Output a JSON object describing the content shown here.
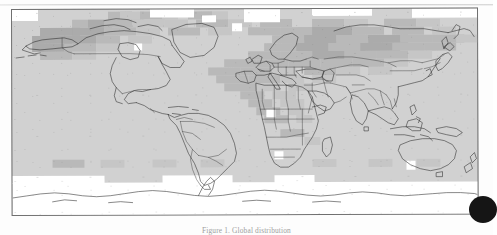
{
  "figure": {
    "kind": "world-map",
    "projection": "equirectangular",
    "caption": "Figure 1.  Global distribution",
    "frame_color": "#6f6f6f",
    "background_color": "#d2d2d2"
  },
  "artifacts": {
    "page_edge_label": "page-edge-line",
    "edge_blob_label": "scan-blob"
  },
  "chart_data": {
    "type": "heatmap",
    "title": "",
    "xlabel": "",
    "ylabel": "",
    "xlim": [
      -180,
      180
    ],
    "ylim": [
      -90,
      90
    ],
    "grid": false,
    "legend": "none",
    "cell_size_deg": [
      6,
      6
    ],
    "palette": {
      "nodata": "#ffffff",
      "level_0": "#d2d2d2",
      "level_1": "#c6c6c6",
      "level_2": "#b9b9b9",
      "level_3": "#ababab",
      "level_4": "#9d9d9d"
    },
    "cells": [
      [
        96,
        2,
        3,
        2
      ],
      [
        108,
        2,
        3,
        1
      ],
      [
        128,
        2,
        3,
        2
      ],
      [
        150,
        2,
        2,
        1
      ],
      [
        176,
        2,
        3,
        2
      ],
      [
        200,
        2,
        2,
        1
      ],
      [
        232,
        2,
        3,
        1
      ],
      [
        60,
        10,
        4,
        2
      ],
      [
        76,
        10,
        3,
        3
      ],
      [
        92,
        10,
        5,
        2
      ],
      [
        120,
        10,
        4,
        1
      ],
      [
        152,
        10,
        3,
        1
      ],
      [
        184,
        10,
        4,
        2
      ],
      [
        216,
        10,
        3,
        1
      ],
      [
        248,
        10,
        4,
        2
      ],
      [
        300,
        10,
        4,
        2
      ],
      [
        332,
        10,
        3,
        1
      ],
      [
        372,
        10,
        4,
        2
      ],
      [
        404,
        10,
        3,
        1
      ],
      [
        28,
        18,
        5,
        3
      ],
      [
        60,
        18,
        4,
        3
      ],
      [
        92,
        18,
        4,
        2
      ],
      [
        124,
        18,
        3,
        1
      ],
      [
        156,
        18,
        4,
        2
      ],
      [
        196,
        18,
        3,
        1
      ],
      [
        236,
        18,
        4,
        2
      ],
      [
        268,
        18,
        4,
        2
      ],
      [
        300,
        18,
        5,
        3
      ],
      [
        340,
        18,
        4,
        2
      ],
      [
        380,
        18,
        4,
        2
      ],
      [
        420,
        18,
        3,
        1
      ],
      [
        20,
        26,
        5,
        3
      ],
      [
        52,
        26,
        4,
        3
      ],
      [
        84,
        26,
        3,
        2
      ],
      [
        116,
        26,
        3,
        1
      ],
      [
        260,
        26,
        4,
        2
      ],
      [
        292,
        26,
        5,
        3
      ],
      [
        324,
        26,
        4,
        2
      ],
      [
        356,
        26,
        5,
        3
      ],
      [
        388,
        26,
        4,
        2
      ],
      [
        420,
        26,
        4,
        2
      ],
      [
        444,
        26,
        3,
        1
      ],
      [
        20,
        34,
        5,
        3
      ],
      [
        52,
        34,
        4,
        2
      ],
      [
        84,
        34,
        3,
        1
      ],
      [
        252,
        34,
        4,
        2
      ],
      [
        284,
        34,
        5,
        3
      ],
      [
        316,
        34,
        4,
        2
      ],
      [
        348,
        34,
        5,
        3
      ],
      [
        380,
        34,
        4,
        2
      ],
      [
        412,
        34,
        4,
        2
      ],
      [
        28,
        42,
        4,
        2
      ],
      [
        60,
        42,
        3,
        1
      ],
      [
        236,
        42,
        4,
        2
      ],
      [
        268,
        42,
        4,
        2
      ],
      [
        300,
        42,
        5,
        3
      ],
      [
        332,
        42,
        4,
        2
      ],
      [
        364,
        42,
        4,
        2
      ],
      [
        396,
        42,
        3,
        1
      ],
      [
        212,
        50,
        4,
        2
      ],
      [
        244,
        50,
        4,
        2
      ],
      [
        276,
        50,
        4,
        2
      ],
      [
        308,
        50,
        4,
        2
      ],
      [
        340,
        50,
        4,
        2
      ],
      [
        372,
        50,
        3,
        1
      ],
      [
        196,
        58,
        4,
        2
      ],
      [
        228,
        58,
        4,
        2
      ],
      [
        260,
        58,
        3,
        1
      ],
      [
        292,
        58,
        4,
        2
      ],
      [
        324,
        58,
        3,
        1
      ],
      [
        356,
        58,
        3,
        1
      ],
      [
        204,
        66,
        4,
        2
      ],
      [
        236,
        66,
        4,
        2
      ],
      [
        268,
        66,
        3,
        1
      ],
      [
        300,
        66,
        3,
        1
      ],
      [
        212,
        74,
        4,
        2
      ],
      [
        244,
        74,
        3,
        1
      ],
      [
        276,
        74,
        3,
        1
      ],
      [
        228,
        82,
        3,
        2
      ],
      [
        260,
        82,
        3,
        1
      ],
      [
        236,
        90,
        3,
        2
      ],
      [
        268,
        90,
        3,
        1
      ],
      [
        244,
        98,
        3,
        2
      ],
      [
        276,
        98,
        2,
        1
      ],
      [
        252,
        106,
        3,
        2
      ],
      [
        284,
        106,
        2,
        1
      ],
      [
        268,
        120,
        3,
        2
      ],
      [
        292,
        128,
        2,
        1
      ],
      [
        40,
        150,
        4,
        2
      ],
      [
        88,
        150,
        3,
        1
      ],
      [
        140,
        150,
        3,
        1
      ],
      [
        188,
        150,
        3,
        1
      ],
      [
        300,
        150,
        3,
        1
      ],
      [
        356,
        150,
        3,
        1
      ],
      [
        404,
        150,
        3,
        1
      ]
    ],
    "regions_shaded_dark": [
      "Alaska",
      "Western Canada",
      "Northern Africa",
      "Eastern Europe",
      "Central Asia",
      "Southern Africa"
    ],
    "regions_no_data": [
      "Antarctica",
      "Arctic Ocean"
    ]
  }
}
